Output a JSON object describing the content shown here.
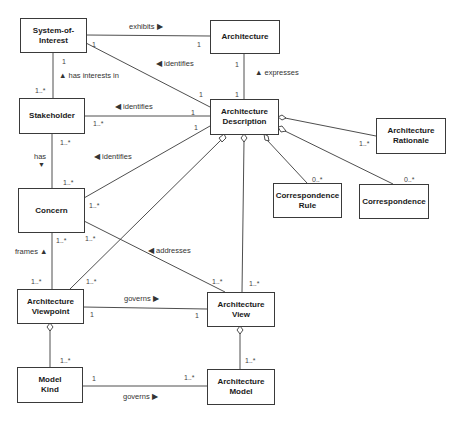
{
  "diagram": {
    "type": "UML class diagram",
    "classes": {
      "system_of_interest": "System-of-\nInterest",
      "architecture": "Architecture",
      "stakeholder": "Stakeholder",
      "architecture_description": "Architecture\nDescription",
      "architecture_rationale": "Architecture\nRationale",
      "correspondence_rule": "Correspondence\nRule",
      "correspondence": "Correspondence",
      "concern": "Concern",
      "architecture_viewpoint": "Architecture\nViewpoint",
      "architecture_view": "Architecture\nView",
      "model_kind": "Model\nKind",
      "architecture_model": "Architecture\nModel"
    },
    "associations": {
      "exhibits": "exhibits ▶",
      "identifies_soi": "◀ identifies",
      "has_interests_in": "▲ has interests in",
      "identifies_stakeholder": "◀ identifies",
      "expresses": "▲ expresses",
      "has": "has",
      "has_arrow": "▼",
      "identifies_concern": "◀ identifies",
      "frames": "frames ▲",
      "addresses": "◀ addresses",
      "governs_view": "governs ▶",
      "governs_model": "governs ▶"
    },
    "multiplicities": {
      "soi_exhibits": "1",
      "arch_exhibits": "1",
      "soi_identifies": "1",
      "ad_identifies_soi": "1",
      "soi_stake": "1",
      "stake_soi": "1..*",
      "arch_expresses": "1",
      "ad_expresses": "1",
      "stake_ad": "1..*",
      "ad_stake": "1",
      "ad_concern": "1",
      "stake_has": "1..*",
      "concern_has": "1..*",
      "concern_ad": "1..*",
      "concern_frames": "1..*",
      "concern_addresses": "1..*",
      "vp_frames": "1..*",
      "vp_ad": "1..*",
      "view_addresses": "1..*",
      "view_ad": "1..*",
      "rationale": "1..*",
      "corr_rule": "0..*",
      "corr": "0..*",
      "vp_governs": "1",
      "view_governs": "1",
      "mk_agg": "1..*",
      "mk_governs": "1",
      "model_governs": "1..*",
      "model_agg": "1..*"
    },
    "caption": "Figure — Model of an architecture description"
  }
}
